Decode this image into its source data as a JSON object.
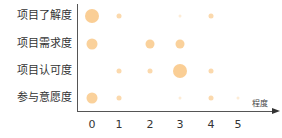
{
  "chart_data": {
    "type": "scatter",
    "subtype": "bubble",
    "title": "",
    "xlabel": "程度",
    "ylabel": "",
    "x_ticks": [
      "0",
      "1",
      "2",
      "3",
      "4",
      "5"
    ],
    "xlim": [
      0,
      5
    ],
    "categories": [
      "项目了解度",
      "项目需求度",
      "项目认可度",
      "参与意愿度"
    ],
    "grid": false,
    "legend": null,
    "color": "#F9C98A",
    "points": [
      {
        "category": "项目了解度",
        "x": 0,
        "size": 5
      },
      {
        "category": "项目了解度",
        "x": 1,
        "size": 2
      },
      {
        "category": "项目了解度",
        "x": 3,
        "size": 1
      },
      {
        "category": "项目了解度",
        "x": 4,
        "size": 2
      },
      {
        "category": "项目需求度",
        "x": 0,
        "size": 4
      },
      {
        "category": "项目需求度",
        "x": 2,
        "size": 3
      },
      {
        "category": "项目需求度",
        "x": 3,
        "size": 3
      },
      {
        "category": "项目认可度",
        "x": 1,
        "size": 2
      },
      {
        "category": "项目认可度",
        "x": 2,
        "size": 2
      },
      {
        "category": "项目认可度",
        "x": 3,
        "size": 5
      },
      {
        "category": "项目认可度",
        "x": 4,
        "size": 2
      },
      {
        "category": "参与意愿度",
        "x": 0,
        "size": 4
      },
      {
        "category": "参与意愿度",
        "x": 1,
        "size": 2
      },
      {
        "category": "参与意愿度",
        "x": 3,
        "size": 1
      },
      {
        "category": "参与意愿度",
        "x": 4,
        "size": 2
      },
      {
        "category": "参与意愿度",
        "x": 5,
        "size": 1
      }
    ]
  },
  "axis": {
    "y_labels": [
      "项目了解度",
      "项目需求度",
      "项目认可度",
      "参与意愿度"
    ],
    "x_ticks": [
      "0",
      "1",
      "2",
      "3",
      "4",
      "5"
    ],
    "x_name": "程度"
  }
}
